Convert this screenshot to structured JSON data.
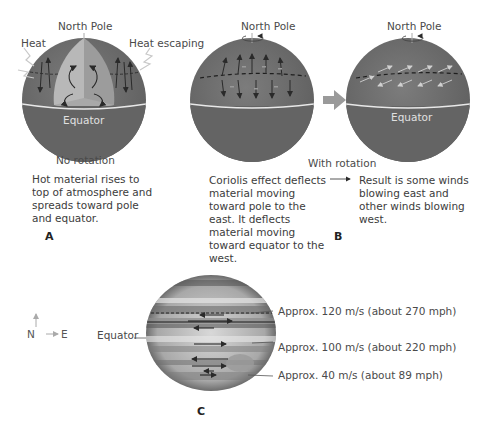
{
  "panelA": {
    "letter": "A",
    "north_pole": "North Pole",
    "heat": "Heat",
    "heat_escaping": "Heat escaping",
    "equator": "Equator",
    "caption": "No rotation",
    "description": "Hot material rises to top of atmosphere and spreads toward pole and equator."
  },
  "panelB": {
    "letter": "B",
    "globe1": {
      "north_pole": "North Pole"
    },
    "globe2": {
      "north_pole": "North Pole",
      "equator": "Equator"
    },
    "caption": "With rotation",
    "description_left": "Coriolis effect deflects material moving toward pole to the east. It deflects material moving toward equator to the west.",
    "arrow": "→",
    "description_right": "Result is some winds blowing east and other winds blowing west."
  },
  "panelC": {
    "letter": "C",
    "compass": {
      "north": "N",
      "east": "E"
    },
    "equator": "Equator",
    "annotations": [
      "Approx. 120 m/s (about 270 mph)",
      "Approx. 100 m/s (about 220 mph)",
      "Approx. 40 m/s (about 89 mph)"
    ]
  },
  "colors": {
    "globe_dark": "#6a6a6a",
    "globe_band": "#7a7a7a",
    "cutaway_light": "#b8b8b8",
    "cutaway_mid": "#9a9a9a",
    "equator_line": "#e8e8e8",
    "transition_arrow": "#9a9a9a"
  }
}
